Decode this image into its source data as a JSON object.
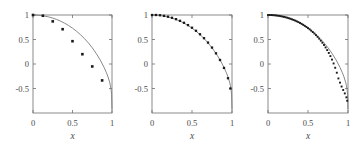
{
  "figure": {
    "width": 363,
    "height": 148,
    "background": "#ffffff",
    "panel_count": 3
  },
  "style": {
    "curve_color": "#7a7a7a",
    "marker_color": "#1a1a1a",
    "axis_color": "#6e6e6e",
    "label_color": "#4a4a4a"
  },
  "chart_data": [
    {
      "type": "scatter",
      "title": "",
      "subtitle": "",
      "xlabel": "x",
      "ylabel": "",
      "xlim": [
        0,
        1
      ],
      "ylim": [
        -1,
        1
      ],
      "xticks": [
        0,
        0.5,
        1
      ],
      "xticklabels": [
        "0",
        "0.5",
        "1"
      ],
      "yticks": [
        -0.5,
        0,
        0.5,
        1
      ],
      "yticklabels": [
        "-0.5",
        "0",
        "0.5",
        "1"
      ],
      "grid": false,
      "legend": "none",
      "annotations": [],
      "series": [
        {
          "name": "model curve",
          "type": "line",
          "x": [
            0,
            0.05,
            0.1,
            0.15,
            0.2,
            0.25,
            0.3,
            0.35,
            0.4,
            0.45,
            0.5,
            0.55,
            0.6,
            0.65,
            0.7,
            0.75,
            0.8,
            0.85,
            0.9,
            0.93,
            0.95,
            0.97,
            0.98,
            0.99,
            0.995,
            1
          ],
          "y": [
            1,
            0.998,
            0.99,
            0.977,
            0.96,
            0.937,
            0.908,
            0.874,
            0.833,
            0.786,
            0.732,
            0.67,
            0.6,
            0.521,
            0.432,
            0.331,
            0.216,
            0.085,
            -0.07,
            -0.18,
            -0.265,
            -0.37,
            -0.44,
            -0.54,
            -0.63,
            -0.92
          ]
        },
        {
          "name": "data points",
          "type": "scatter",
          "x": [
            0.0,
            0.125,
            0.25,
            0.375,
            0.5,
            0.625,
            0.75,
            0.875
          ],
          "y": [
            1.0,
            0.985,
            0.87,
            0.71,
            0.465,
            0.2,
            -0.05,
            -0.335
          ]
        }
      ]
    },
    {
      "type": "scatter",
      "title": "",
      "subtitle": "",
      "xlabel": "x",
      "ylabel": "",
      "xlim": [
        0,
        1
      ],
      "ylim": [
        -1,
        1
      ],
      "xticks": [
        0,
        0.5,
        1
      ],
      "xticklabels": [
        "0",
        "0.5",
        "1"
      ],
      "yticks": [
        -0.5,
        0,
        0.5,
        1
      ],
      "yticklabels": [
        "-0.5",
        "0",
        "0.5",
        "1"
      ],
      "grid": false,
      "legend": "none",
      "annotations": [],
      "series": [
        {
          "name": "model curve",
          "type": "line",
          "x": [
            0,
            0.05,
            0.1,
            0.15,
            0.2,
            0.25,
            0.3,
            0.35,
            0.4,
            0.45,
            0.5,
            0.55,
            0.6,
            0.65,
            0.7,
            0.75,
            0.8,
            0.85,
            0.9,
            0.93,
            0.95,
            0.97,
            0.98,
            0.99,
            0.995,
            1
          ],
          "y": [
            1,
            0.998,
            0.99,
            0.977,
            0.96,
            0.937,
            0.908,
            0.874,
            0.833,
            0.786,
            0.732,
            0.67,
            0.6,
            0.521,
            0.432,
            0.331,
            0.216,
            0.085,
            -0.07,
            -0.18,
            -0.265,
            -0.37,
            -0.44,
            -0.54,
            -0.63,
            -0.92
          ]
        },
        {
          "name": "data points",
          "type": "scatter",
          "x": [
            0.0,
            0.05,
            0.1,
            0.15,
            0.2,
            0.25,
            0.3,
            0.35,
            0.4,
            0.45,
            0.5,
            0.55,
            0.6,
            0.65,
            0.7,
            0.75,
            0.8,
            0.85,
            0.9,
            0.95,
            0.98
          ],
          "y": [
            1.0,
            1.0,
            0.995,
            0.982,
            0.965,
            0.943,
            0.915,
            0.881,
            0.841,
            0.794,
            0.74,
            0.678,
            0.607,
            0.527,
            0.437,
            0.335,
            0.218,
            0.082,
            -0.08,
            -0.29,
            -0.5
          ]
        }
      ]
    },
    {
      "type": "scatter",
      "title": "",
      "subtitle": "",
      "xlabel": "x",
      "ylabel": "",
      "xlim": [
        0,
        1
      ],
      "ylim": [
        -1,
        1
      ],
      "xticks": [
        0,
        0.5,
        1
      ],
      "xticklabels": [
        "0",
        "0.5",
        "1"
      ],
      "yticks": [
        -0.5,
        0,
        0.5,
        1
      ],
      "yticklabels": [
        "-0.5",
        "0",
        "0.5",
        "1"
      ],
      "grid": false,
      "legend": "none",
      "annotations": [],
      "series": [
        {
          "name": "model curve",
          "type": "line",
          "x": [
            0,
            0.05,
            0.1,
            0.15,
            0.2,
            0.25,
            0.3,
            0.35,
            0.4,
            0.45,
            0.5,
            0.55,
            0.6,
            0.65,
            0.7,
            0.75,
            0.8,
            0.85,
            0.9,
            0.93,
            0.95,
            0.97,
            0.98,
            0.99,
            0.995,
            1
          ],
          "y": [
            1,
            0.998,
            0.99,
            0.977,
            0.96,
            0.937,
            0.908,
            0.874,
            0.833,
            0.786,
            0.732,
            0.67,
            0.6,
            0.521,
            0.432,
            0.331,
            0.216,
            0.085,
            -0.07,
            -0.18,
            -0.265,
            -0.37,
            -0.44,
            -0.54,
            -0.63,
            -0.92
          ]
        },
        {
          "name": "data points",
          "type": "scatter",
          "x": [
            0.0,
            0.02,
            0.04,
            0.06,
            0.08,
            0.1,
            0.12,
            0.14,
            0.16,
            0.18,
            0.2,
            0.22,
            0.24,
            0.26,
            0.28,
            0.3,
            0.32,
            0.34,
            0.36,
            0.38,
            0.4,
            0.42,
            0.44,
            0.46,
            0.48,
            0.5,
            0.52,
            0.54,
            0.56,
            0.58,
            0.6,
            0.62,
            0.64,
            0.66,
            0.68,
            0.7,
            0.72,
            0.74,
            0.76,
            0.78,
            0.8,
            0.82,
            0.84,
            0.86,
            0.88,
            0.9,
            0.92,
            0.94,
            0.96,
            0.98,
            0.99
          ],
          "y": [
            1.0,
            1.0,
            0.999,
            0.997,
            0.994,
            0.991,
            0.987,
            0.982,
            0.976,
            0.969,
            0.962,
            0.954,
            0.945,
            0.935,
            0.924,
            0.912,
            0.9,
            0.886,
            0.871,
            0.855,
            0.838,
            0.82,
            0.8,
            0.779,
            0.757,
            0.733,
            0.708,
            0.681,
            0.652,
            0.622,
            0.589,
            0.554,
            0.517,
            0.477,
            0.434,
            0.388,
            0.338,
            0.284,
            0.225,
            0.161,
            0.09,
            0.011,
            -0.077,
            -0.178,
            -0.295,
            -0.38,
            -0.46,
            -0.53,
            -0.6,
            -0.68,
            -0.75
          ]
        }
      ]
    }
  ]
}
